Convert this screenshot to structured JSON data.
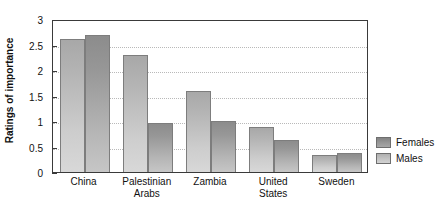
{
  "chart_data": {
    "type": "bar",
    "title": "",
    "xlabel": "",
    "ylabel": "Ratings of importance",
    "ylim": [
      0,
      3
    ],
    "ytick_labels": [
      "0",
      "0.5",
      "1",
      "1.5",
      "2",
      "2.5",
      "3"
    ],
    "ytick_values": [
      0,
      0.5,
      1,
      1.5,
      2,
      2.5,
      3
    ],
    "grid": true,
    "grid_axis": "y",
    "legend_position": "right",
    "categories": [
      "China",
      "Palestinian Arabs",
      "Zambia",
      "United States",
      "Sweden"
    ],
    "category_lines": [
      [
        "China",
        ""
      ],
      [
        "Palestinian",
        "Arabs"
      ],
      [
        "Zambia",
        ""
      ],
      [
        "United",
        "States"
      ],
      [
        "Sweden",
        ""
      ]
    ],
    "series": [
      {
        "name": "Males",
        "color": "#c6c6c6",
        "values": [
          2.6,
          2.29,
          1.59,
          0.88,
          0.33
        ]
      },
      {
        "name": "Females",
        "color": "#9a9a9a",
        "values": [
          2.68,
          0.96,
          1.0,
          0.62,
          0.38
        ]
      }
    ]
  },
  "legend": {
    "items": [
      {
        "label": "Females",
        "swatch": "females"
      },
      {
        "label": "Males",
        "swatch": "males"
      }
    ]
  }
}
